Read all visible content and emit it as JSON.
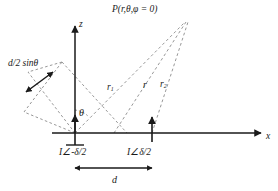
{
  "figure": {
    "colors": {
      "axis": "#1a1a1a",
      "dashed": "#8c8c8c",
      "text": "#1a1a1a",
      "background": "#ffffff"
    },
    "labels": {
      "field_point": "P(r,θ,φ = 0)",
      "z_axis": "z",
      "x_axis": "x",
      "theta": "θ",
      "path_difference": "d/2 sinθ",
      "r1": "r",
      "r1_sub": "1",
      "r": "r",
      "r2": "r",
      "r2_sub": "2",
      "source_left": "I∠-δ/2",
      "source_right": "I∠δ/2",
      "spacing": "d"
    }
  },
  "geometry": {
    "origin": {
      "x": 75,
      "y": 133
    },
    "z_axis_top": {
      "x": 75,
      "y": 25
    },
    "x_axis_right": {
      "x": 262,
      "y": 133
    },
    "field_point": {
      "x": 185,
      "y": 22
    },
    "source_left": {
      "x": 75,
      "y": 133
    },
    "source_right": {
      "x": 152,
      "y": 133
    },
    "spacing_line_y": 168,
    "theta_degrees": 38
  }
}
